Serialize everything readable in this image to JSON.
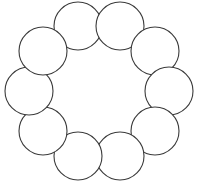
{
  "figure": {
    "background_color": "#ffffff",
    "stroke_color": "#3b3b3b",
    "fill_color": "#ffffff",
    "stroke_width": 1.1,
    "canvas": {
      "width": 198,
      "height": 182
    }
  },
  "chart_data": {
    "type": "scatter",
    "xlabel": "",
    "ylabel": "",
    "grid": false,
    "legend": "none",
    "xlim": [
      0,
      198
    ],
    "ylim": [
      0,
      182
    ],
    "shape": "circle",
    "count": 10,
    "ring_center": {
      "x": 99,
      "y": 91
    },
    "ring_radius": 68,
    "circle_radius": 24,
    "start_angle_deg": -72,
    "categories": [
      "c1",
      "c2",
      "c3",
      "c4",
      "c5",
      "c6",
      "c7",
      "c8",
      "c9",
      "c10"
    ],
    "circles": [
      {
        "id": "c1",
        "label": "top-left",
        "cx": 78,
        "cy": 26,
        "r": 24
      },
      {
        "id": "c2",
        "label": "top-right",
        "cx": 120,
        "cy": 26,
        "r": 24
      },
      {
        "id": "c3",
        "label": "upper-right",
        "cx": 155,
        "cy": 51,
        "r": 24
      },
      {
        "id": "c4",
        "label": "right",
        "cx": 169,
        "cy": 91,
        "r": 24
      },
      {
        "id": "c5",
        "label": "lower-right",
        "cx": 155,
        "cy": 131,
        "r": 24
      },
      {
        "id": "c6",
        "label": "bottom-right",
        "cx": 120,
        "cy": 156,
        "r": 24
      },
      {
        "id": "c7",
        "label": "bottom-left",
        "cx": 78,
        "cy": 156,
        "r": 24
      },
      {
        "id": "c8",
        "label": "lower-left",
        "cx": 43,
        "cy": 131,
        "r": 24
      },
      {
        "id": "c9",
        "label": "left",
        "cx": 29,
        "cy": 91,
        "r": 24
      },
      {
        "id": "c10",
        "label": "upper-left",
        "cx": 43,
        "cy": 51,
        "r": 24
      }
    ],
    "values": [
      24,
      24,
      24,
      24,
      24,
      24,
      24,
      24,
      24,
      24
    ]
  }
}
